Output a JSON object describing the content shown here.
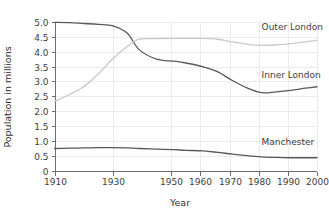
{
  "chart_data": {
    "type": "line",
    "title": "",
    "xlabel": "Year",
    "ylabel": "Population in millions",
    "xlim": [
      1910,
      2000
    ],
    "ylim": [
      0,
      5.0
    ],
    "grid": true,
    "legend_position": "inline-right-of-series",
    "x_ticks": [
      1910,
      1930,
      1950,
      1960,
      1970,
      1980,
      1990,
      2000
    ],
    "x_tick_labels": [
      "1910",
      "1930",
      "1950",
      "1960",
      "1970",
      "1980",
      "1990",
      "2000"
    ],
    "y_ticks": [
      0,
      0.5,
      1.0,
      1.5,
      2.0,
      2.5,
      3.0,
      3.5,
      4.0,
      4.5,
      5.0
    ],
    "y_tick_labels": [
      "0",
      "0.5",
      "1.0",
      "1.5",
      "2.0",
      "2.5",
      "3.0",
      "3.5",
      "4.0",
      "4.5",
      "5.0"
    ],
    "x": [
      1910,
      1915,
      1920,
      1925,
      1930,
      1935,
      1939,
      1945,
      1951,
      1955,
      1961,
      1966,
      1971,
      1976,
      1981,
      1986,
      1991,
      1996,
      2000
    ],
    "series": [
      {
        "name": "Inner London",
        "color": "#595959",
        "label": "Inner London",
        "label_x": 1981,
        "label_y": 3.12,
        "values": [
          4.99,
          4.98,
          4.95,
          4.92,
          4.87,
          4.62,
          4.07,
          3.75,
          3.68,
          3.62,
          3.49,
          3.32,
          3.03,
          2.78,
          2.62,
          2.65,
          2.7,
          2.77,
          2.82
        ]
      },
      {
        "name": "Outer London",
        "color": "#c9c9c9",
        "label": "Outer London",
        "label_x": 1981,
        "label_y": 4.72,
        "values": [
          2.33,
          2.55,
          2.82,
          3.25,
          3.76,
          4.18,
          4.42,
          4.44,
          4.45,
          4.45,
          4.45,
          4.42,
          4.33,
          4.25,
          4.21,
          4.23,
          4.27,
          4.33,
          4.39
        ]
      },
      {
        "name": "Manchester",
        "color": "#595959",
        "label": "Manchester",
        "label_x": 1981,
        "label_y": 0.86,
        "values": [
          0.74,
          0.75,
          0.76,
          0.77,
          0.77,
          0.76,
          0.74,
          0.72,
          0.7,
          0.68,
          0.66,
          0.61,
          0.55,
          0.5,
          0.46,
          0.44,
          0.43,
          0.43,
          0.43
        ]
      }
    ]
  },
  "axes": {
    "x_title": "Year",
    "y_title": "Population in millions"
  },
  "colors": {
    "axis": "#6e6e6e",
    "grid": "#eceaea",
    "text": "#3d3d3d",
    "inner_london": "#595959",
    "outer_london": "#c9c9c9",
    "manchester": "#595959",
    "background": "#ffffff"
  }
}
